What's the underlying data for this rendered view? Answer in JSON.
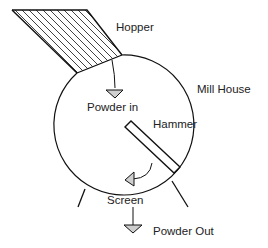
{
  "diagram": {
    "labels": {
      "hopper": "Hopper",
      "mill_house": "Mill House",
      "powder_in": "Powder in",
      "hammer": "Hammer",
      "screen": "Screen",
      "powder_out": "Powder Out"
    },
    "colors": {
      "stroke": "#111111",
      "arrowhead_fill": "#cfcfcf",
      "background": "#ffffff"
    }
  }
}
